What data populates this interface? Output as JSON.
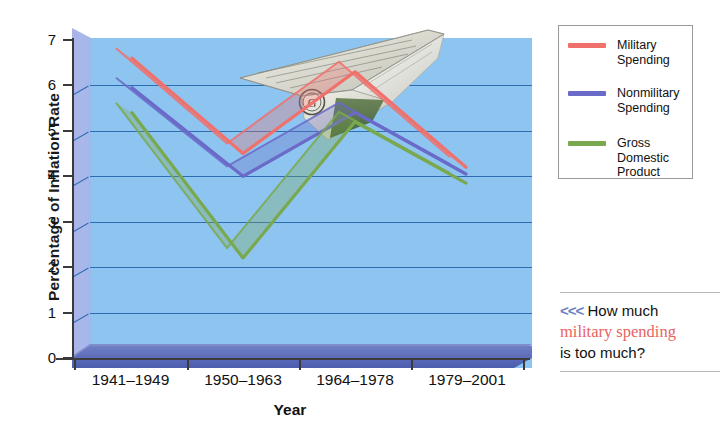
{
  "chart_data": {
    "type": "line",
    "title": "",
    "xlabel": "Year",
    "ylabel": "Percentage of Inflation Rate",
    "categories": [
      "1941–1949",
      "1950–1963",
      "1964–1978",
      "1979–2001"
    ],
    "ylim": [
      0,
      7
    ],
    "yticks": [
      0,
      1,
      2,
      3,
      4,
      5,
      6,
      7
    ],
    "grid": true,
    "legend_position": "right-top",
    "series": [
      {
        "name": "Military Spending",
        "color": "#f0706c",
        "values": [
          6.6,
          4.5,
          6.3,
          4.2
        ]
      },
      {
        "name": "Nonmilitary Spending",
        "color": "#6a6ac8",
        "values": [
          5.95,
          4.0,
          5.4,
          4.05
        ]
      },
      {
        "name": "Gross Domestic Product",
        "color": "#7aa84f",
        "values": [
          5.4,
          2.2,
          5.2,
          3.85
        ]
      }
    ]
  },
  "axes": {
    "ytitle": "Percentage of Inflation Rate",
    "xtitle": "Year",
    "ylabels": [
      "7",
      "6",
      "5",
      "4",
      "3",
      "2",
      "1",
      "0"
    ],
    "xlabels": [
      "1941–1949",
      "1950–1963",
      "1964–1978",
      "1979–2001"
    ]
  },
  "legend": {
    "items": [
      {
        "label_line1": "Military",
        "label_line2": "Spending",
        "label_line3": "",
        "color": "#f0706c"
      },
      {
        "label_line1": "Nonmilitary",
        "label_line2": "Spending",
        "label_line3": "",
        "color": "#6a6ac8"
      },
      {
        "label_line1": "Gross",
        "label_line2": "Domestic",
        "label_line3": "Product",
        "color": "#7aa84f"
      }
    ]
  },
  "callout": {
    "chevrons": "<<<",
    "line1_text": "How much",
    "line2_text": "military spending",
    "line3_text": "is too much?"
  },
  "decoration": {
    "plane_name": "dollar-bill-paper-airplane"
  },
  "colors": {
    "plot_background": "#8ec5f0",
    "gridline": "#2e6db4",
    "floor": "#5b6bb8",
    "wall": "#a9b4e8",
    "military": "#f0706c",
    "nonmilitary": "#6a6ac8",
    "gdp": "#7aa84f",
    "callout_red": "#e8635f",
    "chevron": "#6f7fc4"
  }
}
